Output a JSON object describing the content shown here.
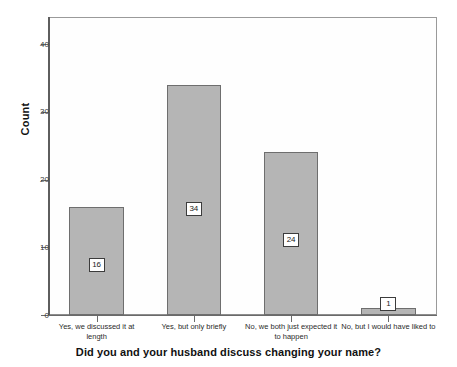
{
  "chart_data": {
    "type": "bar",
    "title": "",
    "xlabel": "Did you and your husband discuss changing your name?",
    "ylabel": "Count",
    "categories": [
      "Yes, we discussed it at length",
      "Yes, but only briefly",
      "No, we both just expected it to happen",
      "No, but I would have liked to"
    ],
    "values": [
      16,
      34,
      24,
      1
    ],
    "value_labels": [
      "16",
      "34",
      "24",
      "1"
    ],
    "ylim": [
      0,
      44
    ],
    "yticks": [
      0,
      10,
      20,
      30,
      40
    ],
    "ytick_labels": [
      "0",
      "10",
      "20",
      "30",
      "40"
    ],
    "grid": false,
    "legend": "none",
    "colors": {
      "bar_fill": "#b5b5b5",
      "bar_edge": "#6e6e6e",
      "plot_background": "#fefefe",
      "frame": "#8d8d8d",
      "axis": "#6a6a6a",
      "text": "#1a1a1a",
      "label_box_fill": "#ffffff",
      "label_box_edge": "#3c3c3c"
    }
  }
}
